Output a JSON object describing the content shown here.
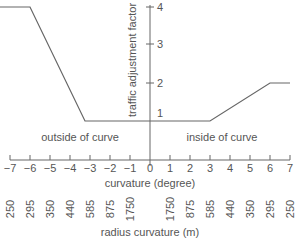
{
  "chart_data": {
    "type": "line",
    "title": "",
    "xlabel": "curvature (degree)",
    "ylabel": "traffic adjustment factor",
    "secondary_xlabel": "radius curvature (m)",
    "x_ticks": [
      -7,
      -6,
      -5,
      -4,
      -3,
      -2,
      -1,
      0,
      1,
      2,
      3,
      4,
      5,
      6,
      7
    ],
    "x_tick_labels": [
      "−7",
      "−6",
      "−5",
      "−4",
      "−3",
      "−2",
      "−1",
      "0",
      "1",
      "2",
      "3",
      "4",
      "5",
      "6",
      "7"
    ],
    "y_ticks": [
      1,
      2,
      3,
      4
    ],
    "y_tick_labels": [
      "1",
      "2",
      "3",
      "4"
    ],
    "radius_labels": [
      "250",
      "295",
      "350",
      "440",
      "585",
      "875",
      "1750",
      "1750",
      "875",
      "585",
      "440",
      "350",
      "295",
      "250"
    ],
    "radius_positions": [
      -7,
      -6,
      -5,
      -4,
      -3,
      -2,
      -1,
      1,
      2,
      3,
      4,
      5,
      6,
      7
    ],
    "annotations": [
      "outside of curve",
      "inside of curve"
    ],
    "xlim": [
      -7.5,
      7
    ],
    "ylim": [
      0,
      4
    ],
    "grid": false,
    "series": [
      {
        "name": "traffic adjustment factor",
        "x": [
          -7.5,
          -6,
          -3.25,
          3,
          6,
          7
        ],
        "y": [
          4,
          4,
          1,
          1,
          2,
          2
        ]
      }
    ]
  },
  "labels": {
    "xlabel": "curvature (degree)",
    "ylabel": "traffic adjustment factor",
    "secondary_xlabel": "radius curvature (m)",
    "outside": "outside of curve",
    "inside": "inside of curve"
  }
}
